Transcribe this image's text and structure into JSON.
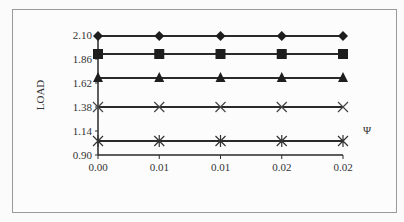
{
  "chart_data": {
    "type": "line",
    "title": "",
    "xlabel": "Ψ",
    "ylabel": "LOAD",
    "x_tick_labels": [
      "0.00",
      "0.01",
      "0.01",
      "0.02",
      "0.02"
    ],
    "y_tick_labels": [
      "2.10",
      "1.86",
      "1.62",
      "1.38",
      "1.14",
      "0.90"
    ],
    "ylim": [
      0.9,
      2.1
    ],
    "grid": false,
    "legend": "none",
    "series": [
      {
        "name": "diamond-series",
        "marker": "diamond",
        "values": [
          2.09,
          2.09,
          2.09,
          2.09,
          2.09
        ]
      },
      {
        "name": "square-series",
        "marker": "square",
        "values": [
          1.91,
          1.91,
          1.91,
          1.91,
          1.91
        ]
      },
      {
        "name": "triangle-series",
        "marker": "triangle",
        "values": [
          1.67,
          1.67,
          1.67,
          1.67,
          1.67
        ]
      },
      {
        "name": "x-series",
        "marker": "x",
        "values": [
          1.38,
          1.38,
          1.38,
          1.38,
          1.38
        ]
      },
      {
        "name": "asterisk-series",
        "marker": "asterisk",
        "values": [
          1.04,
          1.04,
          1.04,
          1.04,
          1.04
        ]
      }
    ]
  }
}
